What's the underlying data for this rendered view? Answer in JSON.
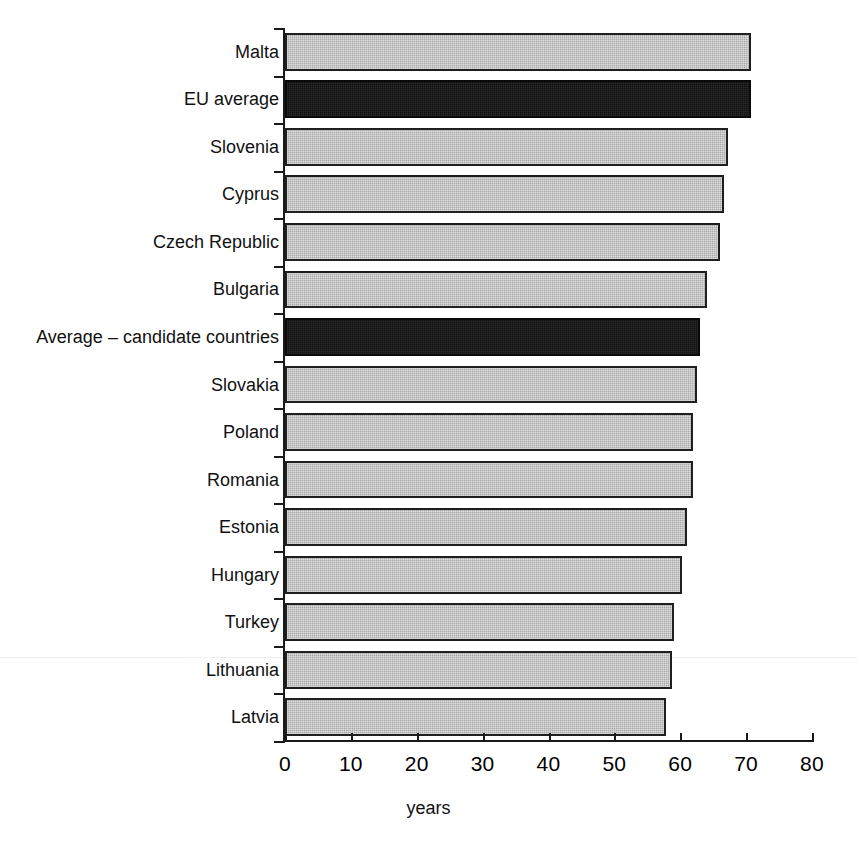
{
  "chart_data": {
    "type": "bar",
    "orientation": "horizontal",
    "title": "",
    "subtitle": "",
    "xlabel": "years",
    "ylabel": "",
    "xlim": [
      0,
      80
    ],
    "xticks": [
      0,
      10,
      20,
      30,
      40,
      50,
      60,
      70,
      80
    ],
    "grid": false,
    "legend": null,
    "categories": [
      "Malta",
      "EU average",
      "Slovenia",
      "Cyprus",
      "Czech Republic",
      "Bulgaria",
      "Average – candidate countries",
      "Slovakia",
      "Poland",
      "Romania",
      "Estonia",
      "Hungary",
      "Turkey",
      "Lithuania",
      "Latvia"
    ],
    "values": [
      70.8,
      70.8,
      67.2,
      66.6,
      66.1,
      64.0,
      63.0,
      62.6,
      62.0,
      61.9,
      61.0,
      60.3,
      59.1,
      58.7,
      57.9
    ],
    "highlight": [
      false,
      true,
      false,
      false,
      false,
      false,
      true,
      false,
      false,
      false,
      false,
      false,
      false,
      false,
      false
    ],
    "series": [
      {
        "name": "healthy life years",
        "values": [
          70.8,
          70.8,
          67.2,
          66.6,
          66.1,
          64.0,
          63.0,
          62.6,
          62.0,
          61.9,
          61.0,
          60.3,
          59.1,
          58.7,
          57.9
        ]
      }
    ],
    "colors": {
      "bar_fill": "#a9a9a9",
      "bar_highlight_fill": "#111111",
      "bar_border": "#1f1f1f",
      "axis": "#1a1a1a",
      "text": "#111111",
      "background": "#ffffff"
    }
  }
}
